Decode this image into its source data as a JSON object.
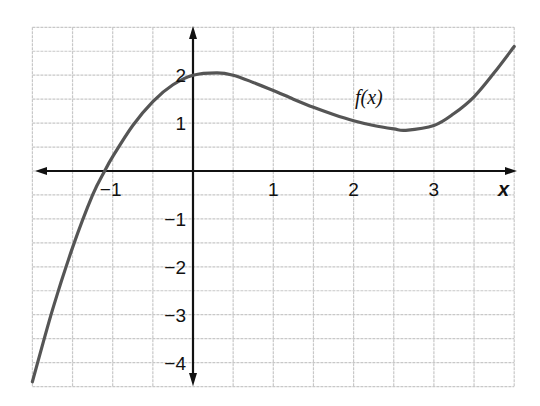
{
  "chart_data": {
    "type": "line",
    "title": "",
    "xlabel": "x",
    "ylabel": "",
    "curve_label": "f(x)",
    "xlim": [
      -2,
      4
    ],
    "ylim": [
      -4.5,
      3
    ],
    "grid": true,
    "grid_step_x": 0.5,
    "grid_step_y": 0.5,
    "x_ticks": [
      -1,
      1,
      2,
      3
    ],
    "x_tick_labels": [
      "−1",
      "1",
      "2",
      "3"
    ],
    "y_ticks": [
      -4,
      -3,
      -2,
      -1,
      1,
      2
    ],
    "y_tick_labels": [
      "−4",
      "−3",
      "−2",
      "−1",
      "1",
      "2"
    ],
    "series": [
      {
        "name": "f(x)",
        "x": [
          -2.0,
          -1.75,
          -1.5,
          -1.25,
          -1.1,
          -1.0,
          -0.75,
          -0.5,
          -0.25,
          0.0,
          0.3,
          0.5,
          0.75,
          1.0,
          1.25,
          1.5,
          1.75,
          2.0,
          2.25,
          2.5,
          2.65,
          3.0,
          3.25,
          3.5,
          3.75,
          4.0
        ],
        "y": [
          -4.4,
          -2.9,
          -1.6,
          -0.5,
          0.0,
          0.3,
          0.95,
          1.45,
          1.8,
          2.0,
          2.05,
          2.0,
          1.85,
          1.68,
          1.5,
          1.33,
          1.18,
          1.05,
          0.95,
          0.88,
          0.85,
          0.95,
          1.2,
          1.55,
          2.05,
          2.6
        ]
      }
    ],
    "colors": {
      "curve": "#555555",
      "axis": "#111111",
      "grid": "#c8c8c8"
    }
  }
}
